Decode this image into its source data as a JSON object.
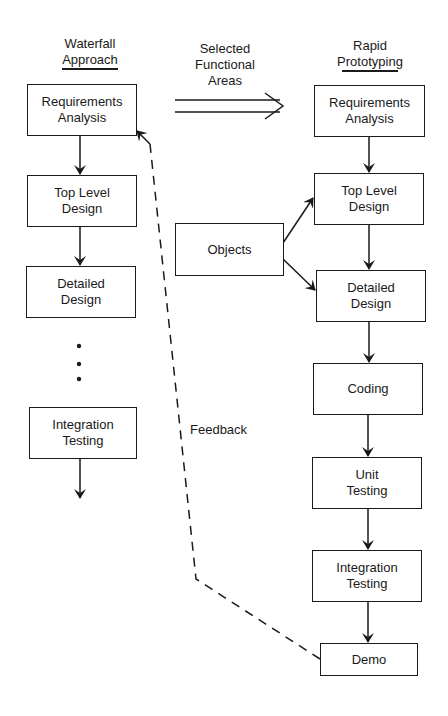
{
  "headings": {
    "waterfall": "Waterfall\nApproach",
    "rapid": "Rapid\nPrototyping",
    "selected_areas": "Selected\nFunctional\nAreas",
    "feedback": "Feedback"
  },
  "waterfall": {
    "steps": [
      "Requirements\nAnalysis",
      "Top Level\nDesign",
      "Detailed\nDesign",
      "Integration\nTesting"
    ],
    "ellipsis": "⋮"
  },
  "rapid": {
    "steps": [
      "Requirements\nAnalysis",
      "Top Level\nDesign",
      "Detailed\nDesign",
      "Coding",
      "Unit\nTesting",
      "Integration\nTesting",
      "Demo"
    ],
    "objects": "Objects"
  },
  "colors": {
    "ink": "#1a1a1a",
    "background": "#ffffff"
  }
}
